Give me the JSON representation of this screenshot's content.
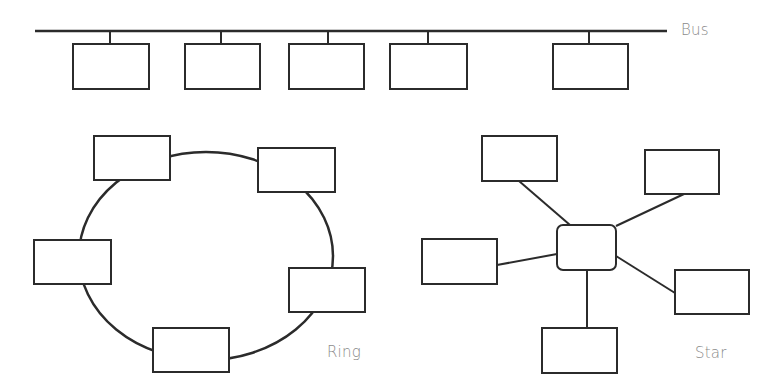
{
  "labels": {
    "bus": "Bus",
    "ring": "Ring",
    "star": "Star"
  },
  "colors": {
    "stroke": "#2b2b2b",
    "label": "#8a8a8a",
    "background": "#ffffff"
  },
  "bus": {
    "line": {
      "x1": 35,
      "x2": 667,
      "y": 31
    },
    "nodes": [
      {
        "x": 73,
        "y": 44,
        "w": 76,
        "h": 45,
        "drop_x": 110
      },
      {
        "x": 185,
        "y": 44,
        "w": 75,
        "h": 45,
        "drop_x": 221
      },
      {
        "x": 289,
        "y": 44,
        "w": 75,
        "h": 45,
        "drop_x": 328
      },
      {
        "x": 390,
        "y": 44,
        "w": 77,
        "h": 45,
        "drop_x": 428
      },
      {
        "x": 553,
        "y": 44,
        "w": 75,
        "h": 45,
        "drop_x": 589
      }
    ]
  },
  "ring": {
    "ellipse": {
      "cx": 206,
      "cy": 256,
      "rx": 127,
      "ry": 104
    },
    "nodes": [
      {
        "x": 94,
        "y": 136,
        "w": 76,
        "h": 44
      },
      {
        "x": 258,
        "y": 148,
        "w": 77,
        "h": 44
      },
      {
        "x": 34,
        "y": 240,
        "w": 77,
        "h": 44
      },
      {
        "x": 289,
        "y": 268,
        "w": 76,
        "h": 44
      },
      {
        "x": 153,
        "y": 328,
        "w": 76,
        "h": 44
      }
    ]
  },
  "star": {
    "hub": {
      "x": 557,
      "y": 225,
      "w": 59,
      "h": 45,
      "r": 6
    },
    "nodes": [
      {
        "x": 482,
        "y": 136,
        "w": 75,
        "h": 45,
        "from": [
          519,
          181
        ],
        "to": [
          570,
          225
        ]
      },
      {
        "x": 645,
        "y": 150,
        "w": 74,
        "h": 44,
        "from": [
          684,
          194
        ],
        "to": [
          616,
          226
        ]
      },
      {
        "x": 422,
        "y": 239,
        "w": 75,
        "h": 45,
        "from": [
          497,
          265
        ],
        "to": [
          557,
          254
        ]
      },
      {
        "x": 675,
        "y": 270,
        "w": 74,
        "h": 44,
        "from": [
          675,
          293
        ],
        "to": [
          616,
          256
        ]
      },
      {
        "x": 542,
        "y": 328,
        "w": 75,
        "h": 45,
        "from": [
          587,
          328
        ],
        "to": [
          587,
          270
        ]
      }
    ]
  }
}
